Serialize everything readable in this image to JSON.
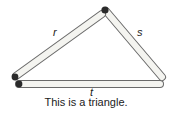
{
  "diagram": {
    "sides": [
      {
        "id": "r",
        "label": "r"
      },
      {
        "id": "s",
        "label": "s"
      },
      {
        "id": "t",
        "label": "t"
      }
    ],
    "caption": "This is a triangle.",
    "colors": {
      "stick_fill": "#f4f4f0",
      "stick_edge": "#6a6a6a",
      "joint": "#2a2a2a"
    }
  }
}
